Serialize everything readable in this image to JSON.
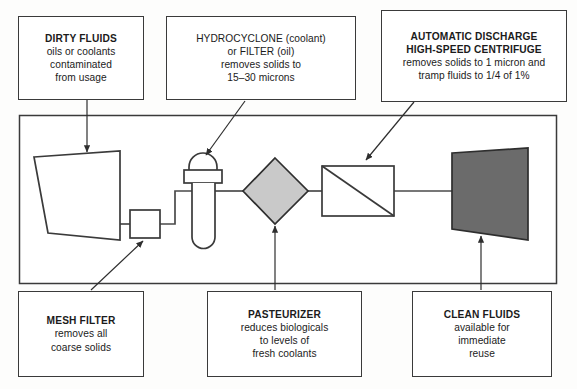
{
  "diagram": {
    "colors": {
      "stroke": "#3a3a3a",
      "line": "#4a4a4a",
      "background": "#ffffff",
      "diamond_fill": "#c9c9c9",
      "centrifuge_fill": "#6b6b6b"
    },
    "callouts": {
      "dirty_fluids": {
        "line1": "DIRTY FLUIDS",
        "line2": "oils or coolants",
        "line3": "contaminated",
        "line4": "from usage"
      },
      "hydrocyclone": {
        "line1": "HYDROCYCLONE (coolant)",
        "line2": "or FILTER (oil)",
        "line3": "removes solids to",
        "line4": "15–30 microns"
      },
      "centrifuge": {
        "line1": "AUTOMATIC DISCHARGE",
        "line2": "HIGH-SPEED CENTRIFUGE",
        "line3": "removes solids to 1 micron and",
        "line4": "tramp fluids to 1/4 of 1%"
      },
      "mesh_filter": {
        "line1": "MESH FILTER",
        "line2": "removes all",
        "line3": "coarse solids"
      },
      "pasteurizer": {
        "line1": "PASTEURIZER",
        "line2": "reduces biologicals",
        "line3": "to levels of",
        "line4": "fresh coolants"
      },
      "clean_fluids": {
        "line1": "CLEAN FLUIDS",
        "line2": "available for",
        "line3": "immediate",
        "line4": "reuse"
      }
    },
    "equipment": {
      "tank": "dirty-fluid-tank",
      "mesh_filter": "mesh-filter-unit",
      "hydrocyclone": "hydrocyclone-vessel",
      "pasteurizer": "pasteurizer-unit",
      "heat_exchanger": "heat-exchanger-unit",
      "centrifuge": "centrifuge-unit"
    }
  }
}
